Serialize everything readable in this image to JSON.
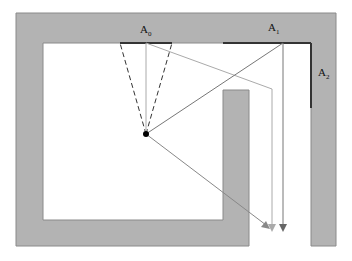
{
  "diagram": {
    "labels": {
      "a0": "A",
      "a0_sub": "0",
      "a1": "A",
      "a1_sub": "1",
      "a2": "A",
      "a2_sub": "2"
    },
    "colors": {
      "wall": "#b3b3b3",
      "wall_edge": "#888888",
      "aperture": "#333333",
      "ray_light": "#aaaaaa",
      "ray_dark": "#777777",
      "source": "#000000"
    }
  }
}
